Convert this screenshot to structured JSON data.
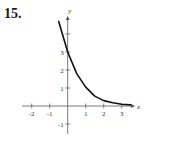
{
  "problem": {
    "number": "15."
  },
  "chart_data": {
    "type": "line",
    "title": "",
    "xlabel": "x",
    "ylabel": "y",
    "xlim": [
      -2.5,
      3.7
    ],
    "ylim": [
      -1.5,
      5
    ],
    "x_ticks": [
      -2,
      -1,
      1,
      2,
      3
    ],
    "x_tick_labels": [
      "-2",
      "-1",
      "1",
      "2",
      "3"
    ],
    "y_ticks": [
      -1,
      1,
      2,
      3,
      4
    ],
    "y_tick_labels": [
      "-1",
      "1",
      "2",
      "3",
      ""
    ],
    "grid": false,
    "legend": null,
    "series": [
      {
        "name": "curve",
        "description": "Decreasing exponential curve, y-intercept near 3, approaching y=0 as x increases (values read off the graph)",
        "x": [
          -0.5,
          0,
          0.5,
          1,
          1.5,
          2,
          2.5,
          3,
          3.5
        ],
        "values": [
          4.7,
          3.0,
          1.8,
          1.05,
          0.55,
          0.3,
          0.18,
          0.1,
          0.06
        ]
      }
    ],
    "style": {
      "color": "#111111",
      "axis_color": "#555555"
    }
  }
}
